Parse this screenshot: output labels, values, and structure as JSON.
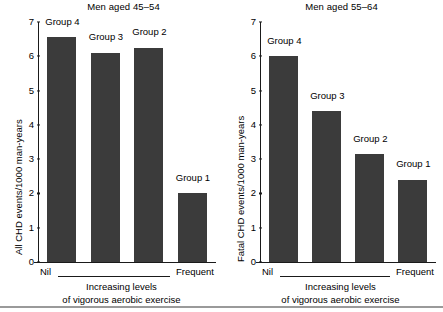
{
  "figure": {
    "background": "#ffffff",
    "bar_color": "#3b3b3b",
    "axis_color": "#1a1a1a",
    "footer_rule_color": "#9a9a9a"
  },
  "chart_data": [
    {
      "type": "bar",
      "title": "Men aged 45–54",
      "xlabel": "Increasing levels of vigorous aerobic exercise",
      "ylabel": "All CHD events/1000 man-years",
      "ylim": [
        0,
        7
      ],
      "yticks": [
        0,
        1,
        2,
        3,
        4,
        5,
        6,
        7
      ],
      "ytick_labels": [
        "0",
        "1",
        "2",
        "3",
        "4",
        "5",
        "6",
        "7"
      ],
      "grid": false,
      "legend": "none",
      "x_axis_start_label": "Nil",
      "x_axis_end_label": "Frequent",
      "categories": [
        "Group 4",
        "Group 3",
        "Group 2",
        "Group 1"
      ],
      "values": [
        6.55,
        6.1,
        6.25,
        2.0
      ],
      "bar_labels": [
        "Group 4",
        "Group 3",
        "Group 2",
        "Group 1"
      ]
    },
    {
      "type": "bar",
      "title": "Men aged 55–64",
      "xlabel": "Increasing levels of vigorous aerobic exercise",
      "ylabel": "Fatal CHD events/1000 man-years",
      "ylim": [
        0,
        7
      ],
      "yticks": [
        0,
        1,
        2,
        3,
        4,
        5,
        6,
        7
      ],
      "ytick_labels": [
        "0",
        "1",
        "2",
        "3",
        "4",
        "5",
        "6",
        "7"
      ],
      "grid": false,
      "legend": "none",
      "x_axis_start_label": "Nil",
      "x_axis_end_label": "Frequent",
      "categories": [
        "Group 4",
        "Group 3",
        "Group 2",
        "Group 1"
      ],
      "values": [
        6.0,
        4.4,
        3.15,
        2.4
      ],
      "bar_labels": [
        "Group 4",
        "Group 3",
        "Group 2",
        "Group 1"
      ]
    }
  ],
  "panels": [
    {
      "title": "Men aged 45–54",
      "ylabel": "All CHD events/1000 man-years",
      "caption_line1": "Increasing levels",
      "caption_line2": "of vigorous aerobic exercise",
      "nil_label": "Nil",
      "frequent_label": "Frequent"
    },
    {
      "title": "Men aged 55–64",
      "ylabel": "Fatal CHD events/1000 man-years",
      "caption_line1": "Increasing levels",
      "caption_line2": "of vigorous aerobic exercise",
      "nil_label": "Nil",
      "frequent_label": "Frequent"
    }
  ]
}
